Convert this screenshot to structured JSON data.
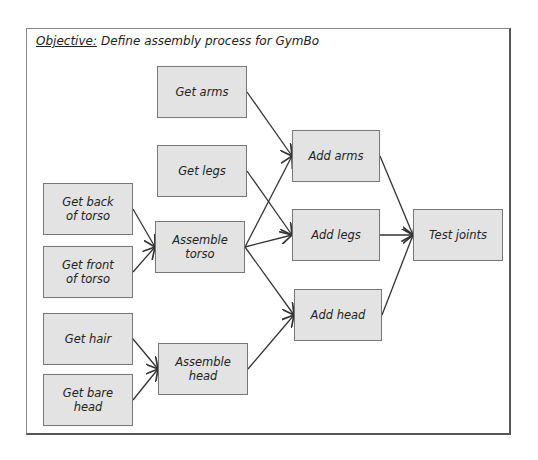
{
  "title": {
    "label": "Objective:",
    "text": "Define assembly process for GymBo"
  },
  "nodes": [
    {
      "id": "get-arms",
      "label": "Get arms",
      "x": 157,
      "y": 66,
      "w": 90,
      "h": 52
    },
    {
      "id": "get-legs",
      "label": "Get legs",
      "x": 157,
      "y": 145,
      "w": 90,
      "h": 52
    },
    {
      "id": "get-back",
      "label": "Get back\nof torso",
      "x": 43,
      "y": 183,
      "w": 90,
      "h": 52
    },
    {
      "id": "get-front",
      "label": "Get front\nof torso",
      "x": 43,
      "y": 246,
      "w": 90,
      "h": 52
    },
    {
      "id": "assemble-torso",
      "label": "Assemble\ntorso",
      "x": 155,
      "y": 221,
      "w": 90,
      "h": 52
    },
    {
      "id": "get-hair",
      "label": "Get hair",
      "x": 43,
      "y": 313,
      "w": 90,
      "h": 52
    },
    {
      "id": "get-bare-head",
      "label": "Get bare\nhead",
      "x": 43,
      "y": 374,
      "w": 90,
      "h": 52
    },
    {
      "id": "assemble-head",
      "label": "Assemble\nhead",
      "x": 158,
      "y": 343,
      "w": 90,
      "h": 52
    },
    {
      "id": "add-arms",
      "label": "Add arms",
      "x": 292,
      "y": 130,
      "w": 88,
      "h": 52
    },
    {
      "id": "add-legs",
      "label": "Add legs",
      "x": 292,
      "y": 209,
      "w": 88,
      "h": 52
    },
    {
      "id": "add-head",
      "label": "Add head",
      "x": 294,
      "y": 289,
      "w": 88,
      "h": 52
    },
    {
      "id": "test-joints",
      "label": "Test joints",
      "x": 413,
      "y": 209,
      "w": 90,
      "h": 52
    }
  ],
  "edges": [
    [
      "get-arms",
      "add-arms"
    ],
    [
      "get-legs",
      "add-legs"
    ],
    [
      "get-back",
      "assemble-torso"
    ],
    [
      "get-front",
      "assemble-torso"
    ],
    [
      "assemble-torso",
      "add-arms"
    ],
    [
      "assemble-torso",
      "add-legs"
    ],
    [
      "assemble-torso",
      "add-head"
    ],
    [
      "get-hair",
      "assemble-head"
    ],
    [
      "get-bare-head",
      "assemble-head"
    ],
    [
      "assemble-head",
      "add-head"
    ],
    [
      "add-arms",
      "test-joints"
    ],
    [
      "add-legs",
      "test-joints"
    ],
    [
      "add-head",
      "test-joints"
    ]
  ]
}
